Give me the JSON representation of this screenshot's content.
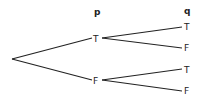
{
  "diagram": {
    "type": "truth-value tree",
    "headers": {
      "p": "p",
      "q": "q"
    },
    "level1": [
      {
        "label": "T",
        "children": [
          {
            "label": "T"
          },
          {
            "label": "F"
          }
        ]
      },
      {
        "label": "F",
        "children": [
          {
            "label": "T"
          },
          {
            "label": "F"
          }
        ]
      }
    ]
  }
}
